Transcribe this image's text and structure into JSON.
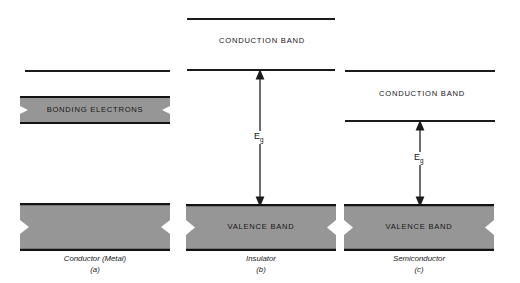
{
  "figure": {
    "type": "energy-band-diagram",
    "background_color": "#ffffff",
    "band_fill_color": "#969696",
    "line_color": "#1a1a1a"
  },
  "panels": [
    {
      "id": "a",
      "caption_name": "Conductor (Metal)",
      "caption_index": "(a)",
      "x": 18,
      "width": 152,
      "conduction_band_label": "",
      "bands": [
        {
          "name": "upper-edge-line",
          "kind": "line",
          "y": 70,
          "label": ""
        },
        {
          "name": "bonding-electrons-band",
          "kind": "filled",
          "top": 97,
          "bottom": 123,
          "label": "BONDING ELECTRONS"
        },
        {
          "name": "valence-band",
          "kind": "filled",
          "top": 204,
          "bottom": 250,
          "label": ""
        }
      ],
      "gap_arrow": null
    },
    {
      "id": "b",
      "caption_name": "Insulator",
      "caption_index": "(b)",
      "x": 187,
      "width": 148,
      "conduction_band_label": "CONDUCTION BAND",
      "bands": [
        {
          "name": "conduction-band-top-line",
          "kind": "line",
          "y": 18,
          "label": ""
        },
        {
          "name": "conduction-band-bottom-line",
          "kind": "line",
          "y": 69,
          "label": ""
        },
        {
          "name": "valence-band",
          "kind": "filled",
          "top": 205,
          "bottom": 250,
          "label": "VALENCE BAND"
        }
      ],
      "gap_arrow": {
        "label": "E",
        "subscript": "g",
        "top": 69,
        "bottom": 205
      }
    },
    {
      "id": "c",
      "caption_name": "Semiconductor",
      "caption_index": "(c)",
      "x": 345,
      "width": 150,
      "conduction_band_label": "CONDUCTION BAND",
      "bands": [
        {
          "name": "conduction-band-top-line",
          "kind": "line",
          "y": 70,
          "label": ""
        },
        {
          "name": "conduction-band-bottom-line",
          "kind": "line",
          "y": 120,
          "label": ""
        },
        {
          "name": "valence-band",
          "kind": "filled",
          "top": 205,
          "bottom": 250,
          "label": "VALENCE BAND"
        }
      ],
      "gap_arrow": {
        "label": "E",
        "subscript": "g",
        "top": 120,
        "bottom": 205
      }
    }
  ],
  "labels": {
    "panel_a_band_label": "BONDING ELECTRONS",
    "panel_b_conduction": "CONDUCTION BAND",
    "panel_b_valence": "VALENCE BAND",
    "panel_b_caption": "Insulator",
    "panel_b_caption_index": "(b)",
    "panel_c_conduction": "CONDUCTION BAND",
    "panel_c_valence": "VALENCE BAND",
    "panel_c_caption": "Semiconductor",
    "panel_c_caption_index": "(c)",
    "panel_a_caption": "Conductor (Metal)",
    "panel_a_caption_index": "(a)",
    "energy_gap_symbol": "E",
    "energy_gap_subscript": "g"
  }
}
